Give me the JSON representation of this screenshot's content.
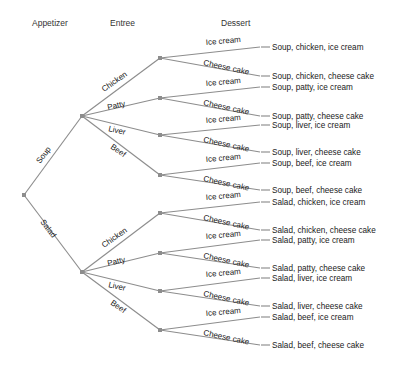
{
  "headers": [
    {
      "label": "Appetizer",
      "x": 32,
      "y": 26
    },
    {
      "label": "Entree",
      "x": 110,
      "y": 26
    },
    {
      "label": "Dessert",
      "x": 221,
      "y": 26
    }
  ],
  "colors": {
    "line": "#8d8d8d",
    "text": "#1a1a1a",
    "header_text": "#333333",
    "background": "#ffffff"
  },
  "tree": {
    "root": {
      "x": 24,
      "y": 195
    },
    "appetizers": [
      {
        "label": "Soup",
        "x": 82,
        "y": 116,
        "label_x": 40,
        "label_y": 164,
        "angle": -53
      },
      {
        "label": "Salad",
        "x": 82,
        "y": 272,
        "label_x": 40,
        "label_y": 222,
        "angle": 53
      }
    ],
    "entrees": [
      {
        "label": "Chicken",
        "parent": 0,
        "x": 160,
        "y": 58,
        "label_x": 104,
        "label_y": 92,
        "angle": -35
      },
      {
        "label": "Patty",
        "parent": 0,
        "x": 160,
        "y": 98,
        "label_x": 108,
        "label_y": 110,
        "angle": -13
      },
      {
        "label": "Liver",
        "parent": 0,
        "x": 160,
        "y": 135,
        "label_x": 108,
        "label_y": 131,
        "angle": 13
      },
      {
        "label": "Beef",
        "parent": 0,
        "x": 160,
        "y": 175,
        "label_x": 110,
        "label_y": 148,
        "angle": 35
      },
      {
        "label": "Chicken",
        "parent": 1,
        "x": 160,
        "y": 213,
        "label_x": 104,
        "label_y": 248,
        "angle": -35
      },
      {
        "label": "Patty",
        "parent": 1,
        "x": 160,
        "y": 253,
        "label_x": 108,
        "label_y": 266,
        "angle": -13
      },
      {
        "label": "Liver",
        "parent": 1,
        "x": 160,
        "y": 291,
        "label_x": 108,
        "label_y": 287,
        "angle": 13
      },
      {
        "label": "Beef",
        "parent": 1,
        "x": 160,
        "y": 330,
        "label_x": 110,
        "label_y": 304,
        "angle": 35
      }
    ],
    "desserts": [
      {
        "label": "Ice cream",
        "parent": 0,
        "end_y": 47,
        "label_x": 206,
        "label_y": 45,
        "angle": -5
      },
      {
        "label": "Cheese cake",
        "parent": 0,
        "end_y": 76,
        "label_x": 203,
        "label_y": 65,
        "angle": 12
      },
      {
        "label": "Ice cream",
        "parent": 1,
        "end_y": 87,
        "label_x": 206,
        "label_y": 86,
        "angle": -5
      },
      {
        "label": "Cheese cake",
        "parent": 1,
        "end_y": 116,
        "label_x": 203,
        "label_y": 105,
        "angle": 12
      },
      {
        "label": "Ice cream",
        "parent": 2,
        "end_y": 125,
        "label_x": 206,
        "label_y": 123,
        "angle": -5
      },
      {
        "label": "Cheese cake",
        "parent": 2,
        "end_y": 152,
        "label_x": 203,
        "label_y": 142,
        "angle": 12
      },
      {
        "label": "Ice cream",
        "parent": 3,
        "end_y": 163,
        "label_x": 206,
        "label_y": 162,
        "angle": -5
      },
      {
        "label": "Cheese cake",
        "parent": 3,
        "end_y": 190,
        "label_x": 203,
        "label_y": 181,
        "angle": 12
      },
      {
        "label": "Ice cream",
        "parent": 4,
        "end_y": 202,
        "label_x": 206,
        "label_y": 200,
        "angle": -5
      },
      {
        "label": "Cheese cake",
        "parent": 4,
        "end_y": 230,
        "label_x": 203,
        "label_y": 220,
        "angle": 12
      },
      {
        "label": "Ice cream",
        "parent": 5,
        "end_y": 240,
        "label_x": 206,
        "label_y": 239,
        "angle": -5
      },
      {
        "label": "Cheese cake",
        "parent": 5,
        "end_y": 268,
        "label_x": 203,
        "label_y": 258,
        "angle": 12
      },
      {
        "label": "Ice cream",
        "parent": 6,
        "end_y": 278,
        "label_x": 206,
        "label_y": 277,
        "angle": -5
      },
      {
        "label": "Cheese cake",
        "parent": 6,
        "end_y": 306,
        "label_x": 203,
        "label_y": 296,
        "angle": 12
      },
      {
        "label": "Ice cream",
        "parent": 7,
        "end_y": 317,
        "label_x": 206,
        "label_y": 316,
        "angle": -5
      },
      {
        "label": "Cheese cake",
        "parent": 7,
        "end_y": 345,
        "label_x": 203,
        "label_y": 335,
        "angle": 12
      }
    ],
    "dessert_line_end_x": 260,
    "stub_start_x": 261,
    "stub_end_x": 270,
    "outcome_text_x": 272
  },
  "outcomes": [
    {
      "text": "Soup, chicken, ice cream",
      "y": 47
    },
    {
      "text": "Soup, chicken, cheese cake",
      "y": 76
    },
    {
      "text": "Soup, patty, ice cream",
      "y": 87
    },
    {
      "text": "Soup, patty, cheese cake",
      "y": 116
    },
    {
      "text": "Soup, liver, ice cream",
      "y": 125
    },
    {
      "text": "Soup, liver, cheese cake",
      "y": 152
    },
    {
      "text": "Soup, beef, ice cream",
      "y": 163
    },
    {
      "text": "Soup, beef, cheese cake",
      "y": 190
    },
    {
      "text": "Salad, chicken, ice cream",
      "y": 202
    },
    {
      "text": "Salad, chicken, cheese cake",
      "y": 230
    },
    {
      "text": "Salad, patty, ice cream",
      "y": 240
    },
    {
      "text": "Salad, patty, cheese cake",
      "y": 268
    },
    {
      "text": "Salad, liver, ice cream",
      "y": 278
    },
    {
      "text": "Salad, liver, cheese cake",
      "y": 306
    },
    {
      "text": "Salad, beef, ice cream",
      "y": 317
    },
    {
      "text": "Salad, beef, cheese cake",
      "y": 345
    }
  ]
}
